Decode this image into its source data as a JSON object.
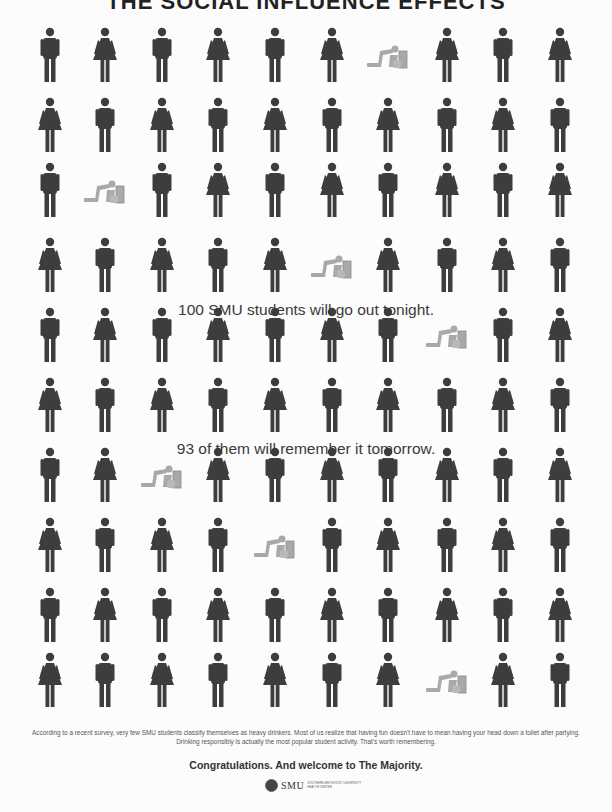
{
  "poster": {
    "title_partial": "THE SOCIAL INFLUENCE EFFECTS",
    "caption_1": "100 SMU students will go out tonight.",
    "caption_2": "93 of them will remember it tomorrow.",
    "footnote": "According to a recent survey, very few SMU students classify themselves as heavy drinkers. Most of us realize that having fun doesn't have to mean having your head down a toilet after partying. Drinking responsibly is actually the most popular student activity. That's worth remembering.",
    "tagline": "Congratulations.  And welcome to The Majority.",
    "logo": {
      "name": "SMU",
      "sub_line_1": "SOUTHERN METHODIST UNIVERSITY",
      "sub_line_2": "HEALTH CENTER"
    }
  },
  "colors": {
    "figure": "#3d3d3d",
    "vomit_figure": "#a9a9a9",
    "background": "#fcfcfc",
    "text": "#333333"
  },
  "grid": {
    "columns": 10,
    "rows": 10,
    "legend": {
      "M": "male-figure-icon",
      "F": "female-figure-icon",
      "V": "vomiting-figure-icon"
    },
    "cells": [
      [
        "M",
        "F",
        "M",
        "F",
        "M",
        "F",
        "V",
        "F",
        "M",
        "F"
      ],
      [
        "F",
        "M",
        "F",
        "M",
        "F",
        "M",
        "F",
        "M",
        "F",
        "M"
      ],
      [
        "M",
        "V",
        "M",
        "F",
        "M",
        "F",
        "M",
        "F",
        "M",
        "F"
      ],
      [
        "F",
        "M",
        "F",
        "M",
        "F",
        "V",
        "F",
        "M",
        "F",
        "M"
      ],
      [
        "M",
        "F",
        "M",
        "F",
        "M",
        "F",
        "M",
        "V",
        "M",
        "F"
      ],
      [
        "F",
        "M",
        "F",
        "M",
        "F",
        "M",
        "F",
        "M",
        "F",
        "M"
      ],
      [
        "M",
        "F",
        "V",
        "F",
        "M",
        "F",
        "M",
        "F",
        "M",
        "F"
      ],
      [
        "F",
        "M",
        "F",
        "M",
        "V",
        "M",
        "F",
        "M",
        "F",
        "M"
      ],
      [
        "M",
        "F",
        "M",
        "F",
        "M",
        "F",
        "M",
        "F",
        "M",
        "F"
      ],
      [
        "F",
        "M",
        "F",
        "M",
        "F",
        "M",
        "F",
        "V",
        "F",
        "M"
      ]
    ],
    "column_x": [
      50,
      105,
      162,
      218,
      275,
      332,
      388,
      447,
      503,
      560
    ],
    "row_y": [
      55,
      125,
      190,
      265,
      335,
      405,
      475,
      545,
      615,
      680
    ]
  },
  "stats": {
    "total_students": 100,
    "remember_tomorrow": 93,
    "vomiting_count": 7
  }
}
